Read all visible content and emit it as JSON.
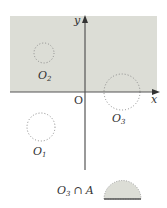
{
  "diagram": {
    "axes": {
      "x_label": "x",
      "y_label": "y",
      "origin_label": "O"
    },
    "region_A": {
      "description": "shaded upper half-plane region",
      "fill": "#dcddd6"
    },
    "circles": [
      {
        "id": "O1",
        "label_main": "O",
        "label_sub": "1",
        "position": "below x-axis, left of y-axis"
      },
      {
        "id": "O2",
        "label_main": "O",
        "label_sub": "2",
        "position": "inside shaded region, left of y-axis"
      },
      {
        "id": "O3",
        "label_main": "O",
        "label_sub": "3",
        "position": "centered on x-axis, right of y-axis"
      }
    ],
    "intersection": {
      "label_main": "O",
      "label_sub": "3",
      "label_op": "∩",
      "label_set": "A",
      "shape": "upper half-disk"
    },
    "colors": {
      "shade": "#dcddd6",
      "axis": "#555555",
      "dots": "#8a8a8a",
      "base_line": "#555555"
    }
  }
}
